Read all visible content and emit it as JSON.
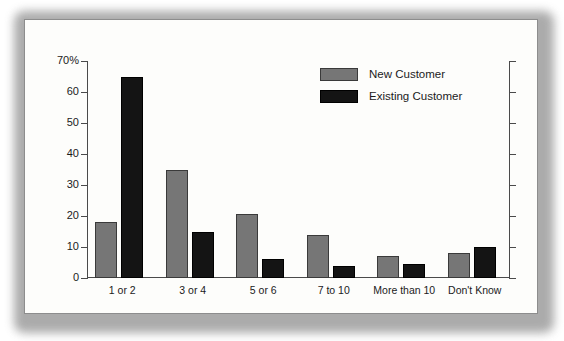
{
  "chart_data": {
    "type": "bar",
    "title": "",
    "subtitle": "",
    "xlabel": "",
    "ylabel": "",
    "ylim": [
      0,
      70
    ],
    "ytick_labels": [
      "0",
      "10",
      "20",
      "30",
      "40",
      "50",
      "60",
      "70%"
    ],
    "ytick_values": [
      0,
      10,
      20,
      30,
      40,
      50,
      60,
      70
    ],
    "grid": false,
    "legend_position": "upper-right-inside",
    "categories": [
      "1 or 2",
      "3 or 4",
      "5 or 6",
      "7 to 10",
      "More than 10",
      "Don't Know"
    ],
    "series": [
      {
        "name": "New Customer",
        "color": "#767676",
        "values": [
          18,
          35,
          20.5,
          14,
          7,
          8
        ]
      },
      {
        "name": "Existing Customer",
        "color": "#141414",
        "values": [
          65,
          15,
          6,
          4,
          4.5,
          10
        ]
      }
    ]
  },
  "legend": {
    "entries": [
      {
        "label": "New Customer"
      },
      {
        "label": "Existing Customer"
      }
    ]
  }
}
